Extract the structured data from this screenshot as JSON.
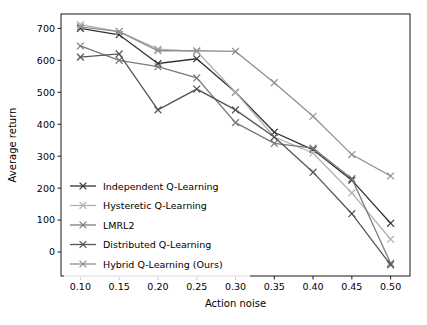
{
  "chart_data": {
    "type": "line",
    "title": "",
    "xlabel": "Action noise",
    "ylabel": "Average return",
    "x": [
      0.1,
      0.15,
      0.2,
      0.25,
      0.3,
      0.35,
      0.4,
      0.45,
      0.5
    ],
    "xticks": [
      "0.10",
      "0.15",
      "0.20",
      "0.25",
      "0.30",
      "0.35",
      "0.40",
      "0.45",
      "0.50"
    ],
    "yticks": [
      "0",
      "100",
      "200",
      "300",
      "400",
      "500",
      "600",
      "700"
    ],
    "xlim": [
      0.075,
      0.525
    ],
    "ylim": [
      -75,
      745
    ],
    "grid": false,
    "legend_position": "lower left",
    "series": [
      {
        "name": "Independent Q-Learning",
        "color": "#333333",
        "marker": "x",
        "values": [
          700,
          680,
          590,
          605,
          500,
          375,
          320,
          225,
          90
        ]
      },
      {
        "name": "Hysteretic Q-Learning",
        "color": "#b0b0b0",
        "marker": "x",
        "values": [
          712,
          690,
          635,
          628,
          500,
          360,
          310,
          185,
          40
        ]
      },
      {
        "name": "LMRL2",
        "color": "#7a7a7a",
        "marker": "x",
        "values": [
          645,
          600,
          580,
          545,
          405,
          340,
          325,
          230,
          -35
        ]
      },
      {
        "name": "Distributed Q-Learning",
        "color": "#555555",
        "marker": "x",
        "values": [
          610,
          620,
          445,
          510,
          445,
          360,
          250,
          120,
          -40
        ]
      },
      {
        "name": "Hybrid Q-Learning (Ours)",
        "color": "#909090",
        "marker": "x",
        "values": [
          705,
          690,
          630,
          630,
          628,
          530,
          425,
          305,
          238
        ]
      }
    ]
  },
  "legend": {
    "entries": [
      "Independent Q-Learning",
      "Hysteretic Q-Learning",
      "LMRL2",
      "Distributed Q-Learning",
      "Hybrid Q-Learning (Ours)"
    ]
  }
}
